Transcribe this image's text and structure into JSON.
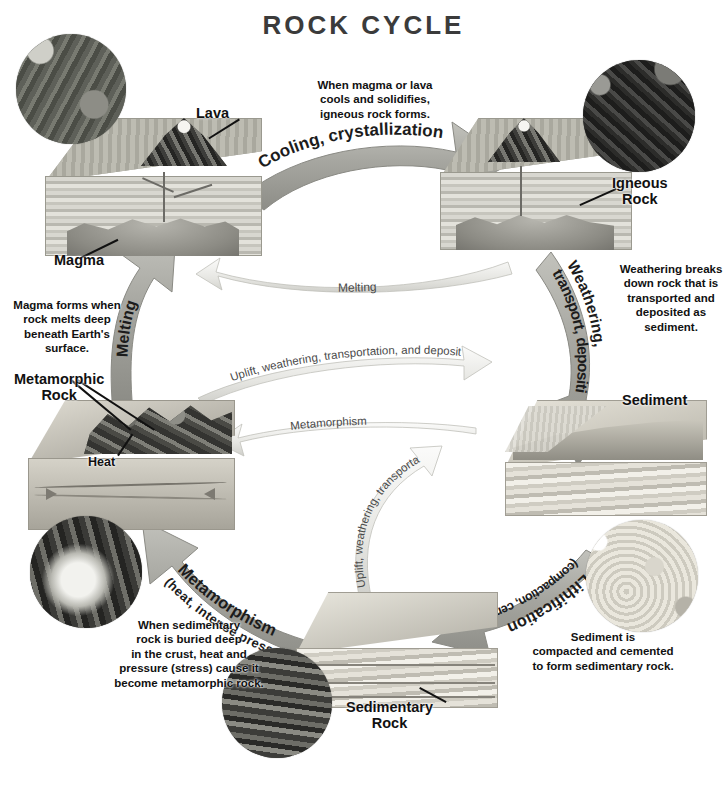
{
  "title": "ROCK CYCLE",
  "stages": {
    "lava": "Lava",
    "magma": "Magma",
    "igneous": "Igneous\nRock",
    "igneous_line1": "Igneous",
    "igneous_line2": "Rock",
    "sediment": "Sediment",
    "metamorphic_line1": "Metamorphic",
    "metamorphic_line2": "Rock",
    "heat": "Heat",
    "sedimentary_line1": "Sedimentary",
    "sedimentary_line2": "Rock"
  },
  "arrows": {
    "cooling": "Cooling, crystallization",
    "weathering_line1": "Weathering,",
    "weathering_line2": "transport, deposition",
    "melting_major": "Melting",
    "melting_minor": "Melting",
    "uplift_upper": "Uplift, weathering, transportation, and deposition",
    "uplift_lower": "Uplift, weathering, transportation, and deposition",
    "metamorphism_minor": "Metamorphism",
    "metamorphism_line1": "Metamorphism",
    "metamorphism_line2": "(heat, intense pressure)",
    "lithification_line1": "Lithification",
    "lithification_line2": "(compaction, cementation)"
  },
  "notes": {
    "cooling": [
      "When magma or lava",
      "cools and solidifies,",
      "igneous rock forms."
    ],
    "weathering": [
      "Weathering breaks",
      "down rock that is",
      "transported and",
      "deposited as",
      "sediment."
    ],
    "melting": [
      "Magma forms when",
      "rock melts deep",
      "beneath Earth's",
      "surface."
    ],
    "metamorphism": [
      "When sedimentary",
      "rock is buried deep",
      "in the crust, heat and",
      "pressure (stress) cause it",
      "become metamorphic rock."
    ],
    "lithification": [
      "Sediment is",
      "compacted and cemented",
      "to form sedimentary rock."
    ]
  },
  "photos": {
    "forest": "forest-outcrop-photo",
    "igneous": "dark-igneous-rock-photo",
    "lava": "lava-flow-photo",
    "sandstone": "sand-grains-photo",
    "canyon": "canyon-strata-photo"
  },
  "colors": {
    "title": "#3b3b3b",
    "arrow_major": "#a8a8a2",
    "arrow_minor": "#e8e8e4",
    "text": "#111111",
    "background": "#ffffff"
  }
}
